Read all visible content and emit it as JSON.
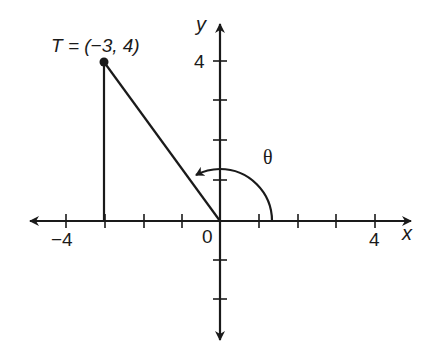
{
  "diagram": {
    "point_label": "T = (−3, 4)",
    "point": {
      "x": -3,
      "y": 4
    },
    "angle_label": "θ",
    "x_axis_label": "x",
    "y_axis_label": "y",
    "origin_label": "0",
    "x_tick_labels": {
      "neg4": "−4",
      "pos4": "4"
    },
    "y_tick_labels": {
      "pos4": "4"
    },
    "x_range": [
      -5,
      5
    ],
    "y_range": [
      -3,
      5
    ],
    "colors": {
      "stroke": "#1a1a1a",
      "background": "#ffffff"
    }
  }
}
